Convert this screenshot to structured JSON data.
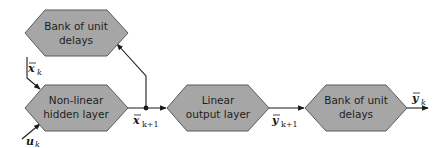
{
  "diagram": {
    "nodes": {
      "delay_top": {
        "line1": "Bank of unit",
        "line2": "delays"
      },
      "hidden": {
        "line1": "Non-linear",
        "line2": "hidden layer"
      },
      "output": {
        "line1": "Linear",
        "line2": "output layer"
      },
      "delay_right": {
        "line1": "Bank of unit",
        "line2": "delays"
      }
    },
    "labels": {
      "x_k": {
        "base": "x",
        "sub": "k"
      },
      "u_k": {
        "base": "u",
        "sub": "k"
      },
      "x_k1": {
        "base": "x",
        "sub": "k+1"
      },
      "y_k1": {
        "base": "y",
        "sub": "k+1"
      },
      "y_k": {
        "base": "y",
        "sub": "k"
      }
    },
    "colors": {
      "node_fill": "#a6a6a6",
      "node_border": "#5a5a5a",
      "edge": "#1a1a1a"
    }
  }
}
